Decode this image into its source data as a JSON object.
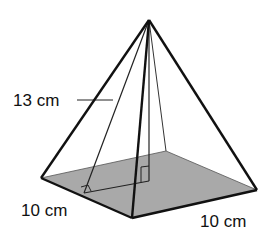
{
  "figure": {
    "type": "square pyramid",
    "labels": {
      "slant_height": "13 cm",
      "base_left_edge": "10 cm",
      "base_right_edge": "10 cm"
    },
    "colors": {
      "base_fill": "#a9a9a9",
      "edge": "#111111",
      "background": "#ffffff"
    }
  }
}
